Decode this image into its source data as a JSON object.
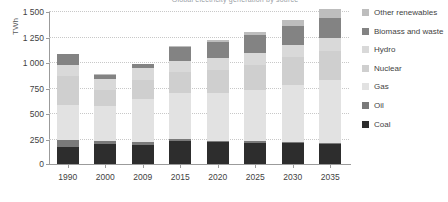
{
  "chart_data": {
    "type": "bar",
    "stacked": true,
    "title": "Global electricity generation by source",
    "xlabel": "",
    "ylabel": "TWh",
    "ylim": [
      0,
      1500
    ],
    "ytick_values": [
      0,
      250,
      500,
      750,
      1000,
      1250,
      1500
    ],
    "ytick_labels": [
      "0",
      "250",
      "500",
      "750",
      "1 000",
      "1 250",
      "1 500"
    ],
    "grid": true,
    "legend_position": "right",
    "categories": [
      "1990",
      "2000",
      "2009",
      "2015",
      "2020",
      "2025",
      "2030",
      "2035"
    ],
    "series": [
      {
        "name": "Coal",
        "color": "#2d2d2d",
        "values": [
          170,
          195,
          190,
          225,
          215,
          210,
          205,
          200
        ]
      },
      {
        "name": "Oil",
        "color": "#7a7a7a",
        "values": [
          65,
          30,
          22,
          18,
          15,
          12,
          10,
          10
        ]
      },
      {
        "name": "Gas",
        "color": "#e2e2e2",
        "values": [
          340,
          345,
          425,
          455,
          470,
          500,
          560,
          610
        ]
      },
      {
        "name": "Nuclear",
        "color": "#cfcfcf",
        "values": [
          290,
          155,
          190,
          205,
          225,
          245,
          270,
          290
        ]
      },
      {
        "name": "Hydro",
        "color": "#d9d9d9",
        "values": [
          110,
          105,
          110,
          110,
          115,
          120,
          125,
          130
        ]
      },
      {
        "name": "Biomass and waste",
        "color": "#838383",
        "values": [
          100,
          45,
          40,
          130,
          160,
          175,
          185,
          195
        ]
      },
      {
        "name": "Other renewables",
        "color": "#bdbdbd",
        "values": [
          5,
          5,
          8,
          12,
          20,
          35,
          60,
          90
        ]
      }
    ],
    "totals": [
      1080,
      880,
      985,
      1155,
      1220,
      1297,
      1415,
      1525
    ],
    "legend_order": [
      "Other renewables",
      "Biomass and waste",
      "Hydro",
      "Nuclear",
      "Gas",
      "Oil",
      "Coal"
    ]
  }
}
